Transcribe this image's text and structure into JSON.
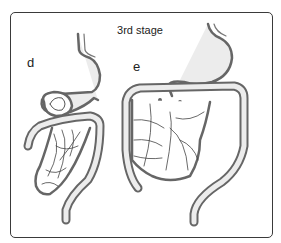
{
  "figure": {
    "title": "3rd stage",
    "panels": [
      {
        "label": "d"
      },
      {
        "label": "e"
      }
    ]
  },
  "colors": {
    "outline": "#555555",
    "fill": "#e8e8e8",
    "frame": "#3a3a3a",
    "vessel": "#444444"
  }
}
